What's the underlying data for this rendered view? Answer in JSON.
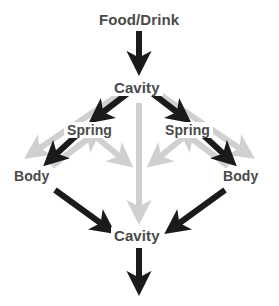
{
  "diagram": {
    "colors": {
      "primary_arrow": "#1a1a1a",
      "secondary_arrow": "#d0d0d0",
      "text": "#4a4a4a",
      "background": "#ffffff"
    },
    "nodes": {
      "source": "Food/Drink",
      "cavity_top": "Cavity",
      "spring_left": "Spring",
      "spring_right": "Spring",
      "body_left": "Body",
      "body_right": "Body",
      "cavity_bottom": "Cavity"
    },
    "edges": [
      {
        "from": "Food/Drink",
        "to": "Cavity",
        "style": "primary",
        "direction": "down"
      },
      {
        "from": "Cavity",
        "to": "Spring",
        "style": "primary",
        "direction": "down-left"
      },
      {
        "from": "Cavity",
        "to": "Spring",
        "style": "primary",
        "direction": "down-right"
      },
      {
        "from": "Cavity",
        "to": "Body",
        "style": "secondary",
        "direction": "down-left"
      },
      {
        "from": "Cavity",
        "to": "Body",
        "style": "secondary",
        "direction": "down-right"
      },
      {
        "from": "Cavity",
        "to": "Cavity",
        "style": "secondary",
        "direction": "down"
      },
      {
        "from": "Spring",
        "to": "Body",
        "style": "primary",
        "direction": "down-left"
      },
      {
        "from": "Spring",
        "to": "Body",
        "style": "primary",
        "direction": "down-right"
      },
      {
        "from": "Body",
        "to": "Spring",
        "style": "secondary",
        "direction": "up-right"
      },
      {
        "from": "Body",
        "to": "Spring",
        "style": "secondary",
        "direction": "up-left"
      },
      {
        "from": "Spring",
        "to": "Cavity",
        "style": "secondary",
        "direction": "down-right"
      },
      {
        "from": "Spring",
        "to": "Cavity",
        "style": "secondary",
        "direction": "down-left"
      },
      {
        "from": "Body",
        "to": "Cavity",
        "style": "primary",
        "direction": "down-right"
      },
      {
        "from": "Body",
        "to": "Cavity",
        "style": "primary",
        "direction": "down-left"
      },
      {
        "from": "Cavity",
        "to": "output",
        "style": "primary",
        "direction": "down"
      }
    ]
  }
}
